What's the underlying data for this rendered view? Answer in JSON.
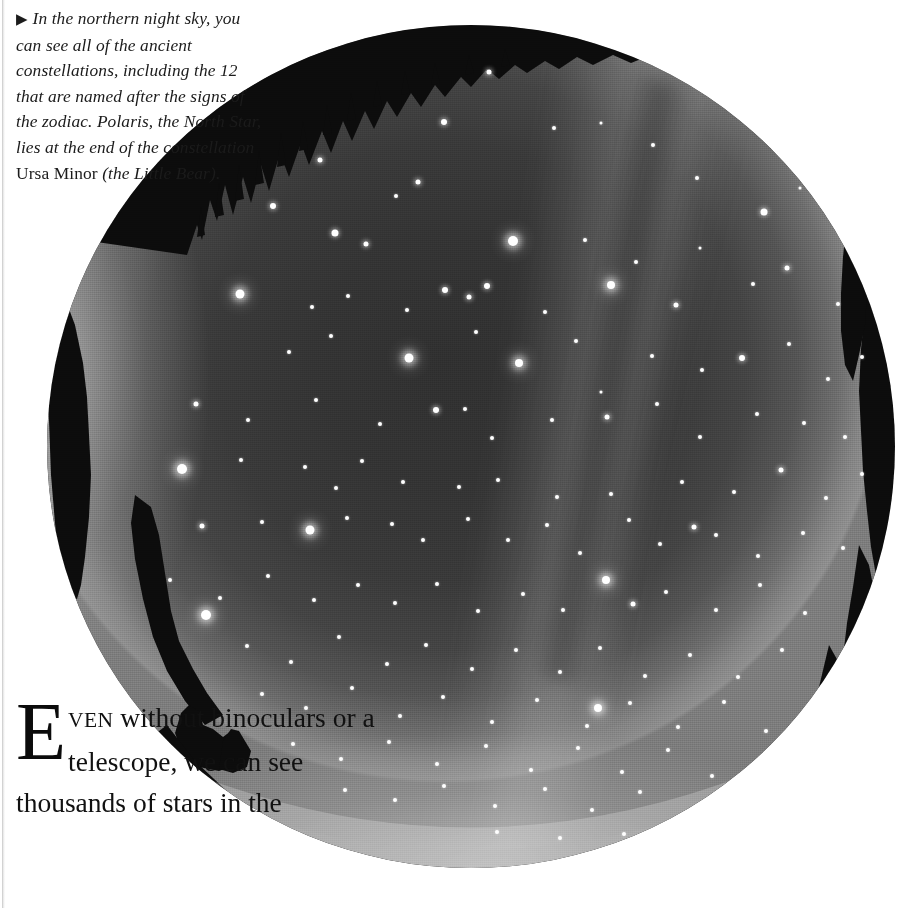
{
  "page": {
    "width": 904,
    "height": 908,
    "background_color": "#ffffff",
    "kind": "scanned-book-page"
  },
  "caption": {
    "marker_icon": "right-triangle-bullet",
    "marker_glyph": "▶",
    "line_1": "In the northern night sky, you can",
    "line_2": "see all of the ancient constellations,",
    "line_3": "including the 12 that are",
    "line_4": "named after the signs of",
    "line_5": "the zodiac. Polaris, the",
    "line_6": "North Star, lies at",
    "line_7": "the end of the",
    "line_8": "constellation",
    "line_9_roman": "Ursa Minor",
    "line_10": "(the Little",
    "line_11": "Bear).",
    "full_text": "▶ In the northern night sky, you can see all of the ancient constellations, including the 12 that are named after the signs of the zodiac. Polaris, the North Star, lies at the end of the constellation Ursa Minor (the Little Bear).",
    "style": "italic-serif",
    "text_color": "#1b1b1b"
  },
  "body": {
    "dropcap": "E",
    "smallcaps": "VEN",
    "line_1_rest": "without",
    "line_2": "binoculars or a",
    "line_3": "telescope, we can see",
    "line_4": "thousands of stars in the",
    "full_text": "EVEN without binoculars or a telescope, we can see thousands of stars in the",
    "style": "roman-serif-with-dropcap",
    "text_color": "#111111"
  },
  "photograph": {
    "name": "all-sky-fisheye-night-sky-photograph",
    "shape": "circle",
    "left": 47,
    "top": 25,
    "width": 848,
    "height": 843,
    "center_x": 471,
    "center_y": 446,
    "radius": 423,
    "sky_color_center": "#303030",
    "sky_color_mid": "#3a3a3a",
    "sky_color_rim": "#8f8f8f",
    "star_color": "#ffffff",
    "silhouette_color": "#0d0d0d",
    "features": [
      "milky-way-band",
      "dark-rift",
      "horizon-airglow",
      "treeline-silhouette"
    ],
    "stars": [
      [
        489,
        72,
        5,
        "med"
      ],
      [
        444,
        122,
        6,
        "med"
      ],
      [
        320,
        160,
        5,
        "med"
      ],
      [
        396,
        196,
        4,
        "sml"
      ],
      [
        554,
        128,
        4,
        "sml"
      ],
      [
        601,
        123,
        3,
        "sml"
      ],
      [
        653,
        145,
        4,
        "sml"
      ],
      [
        697,
        178,
        4,
        "sml"
      ],
      [
        764,
        212,
        7,
        "med"
      ],
      [
        800,
        188,
        3,
        "sml"
      ],
      [
        418,
        182,
        5,
        "med"
      ],
      [
        273,
        206,
        6,
        "med"
      ],
      [
        335,
        233,
        7,
        "med"
      ],
      [
        366,
        244,
        5,
        "med"
      ],
      [
        513,
        241,
        10,
        "big"
      ],
      [
        487,
        286,
        6,
        "med"
      ],
      [
        611,
        285,
        8,
        "big"
      ],
      [
        585,
        240,
        4,
        "sml"
      ],
      [
        636,
        262,
        4,
        "sml"
      ],
      [
        700,
        248,
        3,
        "sml"
      ],
      [
        240,
        294,
        9,
        "big"
      ],
      [
        312,
        307,
        4,
        "sml"
      ],
      [
        348,
        296,
        4,
        "sml"
      ],
      [
        407,
        310,
        4,
        "sml"
      ],
      [
        445,
        290,
        6,
        "med"
      ],
      [
        469,
        297,
        5,
        "med"
      ],
      [
        545,
        312,
        4,
        "sml"
      ],
      [
        676,
        305,
        5,
        "med"
      ],
      [
        753,
        284,
        4,
        "sml"
      ],
      [
        787,
        268,
        5,
        "med"
      ],
      [
        838,
        304,
        4,
        "sml"
      ],
      [
        289,
        352,
        4,
        "sml"
      ],
      [
        331,
        336,
        4,
        "sml"
      ],
      [
        409,
        358,
        9,
        "big"
      ],
      [
        476,
        332,
        4,
        "sml"
      ],
      [
        519,
        363,
        8,
        "big"
      ],
      [
        576,
        341,
        4,
        "sml"
      ],
      [
        601,
        392,
        3,
        "sml"
      ],
      [
        652,
        356,
        4,
        "sml"
      ],
      [
        702,
        370,
        4,
        "sml"
      ],
      [
        742,
        358,
        6,
        "med"
      ],
      [
        789,
        344,
        4,
        "sml"
      ],
      [
        828,
        379,
        4,
        "sml"
      ],
      [
        862,
        357,
        4,
        "sml"
      ],
      [
        196,
        404,
        5,
        "med"
      ],
      [
        248,
        420,
        4,
        "sml"
      ],
      [
        316,
        400,
        4,
        "sml"
      ],
      [
        380,
        424,
        4,
        "sml"
      ],
      [
        436,
        410,
        6,
        "med"
      ],
      [
        465,
        409,
        4,
        "sml"
      ],
      [
        492,
        438,
        4,
        "sml"
      ],
      [
        552,
        420,
        4,
        "sml"
      ],
      [
        607,
        417,
        5,
        "med"
      ],
      [
        657,
        404,
        4,
        "sml"
      ],
      [
        700,
        437,
        4,
        "sml"
      ],
      [
        757,
        414,
        4,
        "sml"
      ],
      [
        804,
        423,
        4,
        "sml"
      ],
      [
        845,
        437,
        4,
        "sml"
      ],
      [
        182,
        469,
        10,
        "big"
      ],
      [
        241,
        460,
        4,
        "sml"
      ],
      [
        305,
        467,
        4,
        "sml"
      ],
      [
        336,
        488,
        4,
        "sml"
      ],
      [
        362,
        461,
        4,
        "sml"
      ],
      [
        403,
        482,
        4,
        "sml"
      ],
      [
        459,
        487,
        4,
        "sml"
      ],
      [
        498,
        480,
        4,
        "sml"
      ],
      [
        557,
        497,
        4,
        "sml"
      ],
      [
        611,
        494,
        4,
        "sml"
      ],
      [
        682,
        482,
        4,
        "sml"
      ],
      [
        734,
        492,
        4,
        "sml"
      ],
      [
        781,
        470,
        5,
        "med"
      ],
      [
        826,
        498,
        4,
        "sml"
      ],
      [
        862,
        474,
        4,
        "sml"
      ],
      [
        202,
        526,
        5,
        "med"
      ],
      [
        262,
        522,
        4,
        "sml"
      ],
      [
        310,
        530,
        9,
        "big"
      ],
      [
        347,
        518,
        4,
        "sml"
      ],
      [
        392,
        524,
        4,
        "sml"
      ],
      [
        423,
        540,
        4,
        "sml"
      ],
      [
        468,
        519,
        4,
        "sml"
      ],
      [
        508,
        540,
        4,
        "sml"
      ],
      [
        547,
        525,
        4,
        "sml"
      ],
      [
        580,
        553,
        4,
        "sml"
      ],
      [
        629,
        520,
        4,
        "sml"
      ],
      [
        660,
        544,
        4,
        "sml"
      ],
      [
        694,
        527,
        5,
        "med"
      ],
      [
        716,
        535,
        4,
        "sml"
      ],
      [
        758,
        556,
        4,
        "sml"
      ],
      [
        803,
        533,
        4,
        "sml"
      ],
      [
        843,
        548,
        4,
        "sml"
      ],
      [
        170,
        580,
        4,
        "sml"
      ],
      [
        220,
        598,
        4,
        "sml"
      ],
      [
        268,
        576,
        4,
        "sml"
      ],
      [
        314,
        600,
        4,
        "sml"
      ],
      [
        358,
        585,
        4,
        "sml"
      ],
      [
        395,
        603,
        4,
        "sml"
      ],
      [
        437,
        584,
        4,
        "sml"
      ],
      [
        478,
        611,
        4,
        "sml"
      ],
      [
        523,
        594,
        4,
        "sml"
      ],
      [
        563,
        610,
        4,
        "sml"
      ],
      [
        606,
        580,
        8,
        "big"
      ],
      [
        633,
        604,
        5,
        "med"
      ],
      [
        666,
        592,
        4,
        "sml"
      ],
      [
        716,
        610,
        4,
        "sml"
      ],
      [
        760,
        585,
        4,
        "sml"
      ],
      [
        805,
        613,
        4,
        "sml"
      ],
      [
        206,
        615,
        10,
        "big"
      ],
      [
        247,
        646,
        4,
        "sml"
      ],
      [
        291,
        662,
        4,
        "sml"
      ],
      [
        339,
        637,
        4,
        "sml"
      ],
      [
        387,
        664,
        4,
        "sml"
      ],
      [
        426,
        645,
        4,
        "sml"
      ],
      [
        472,
        669,
        4,
        "sml"
      ],
      [
        516,
        650,
        4,
        "sml"
      ],
      [
        560,
        672,
        4,
        "sml"
      ],
      [
        600,
        648,
        4,
        "sml"
      ],
      [
        645,
        676,
        4,
        "sml"
      ],
      [
        690,
        655,
        4,
        "sml"
      ],
      [
        738,
        677,
        4,
        "sml"
      ],
      [
        782,
        650,
        4,
        "sml"
      ],
      [
        262,
        694,
        4,
        "sml"
      ],
      [
        306,
        708,
        4,
        "sml"
      ],
      [
        352,
        688,
        4,
        "sml"
      ],
      [
        400,
        716,
        4,
        "sml"
      ],
      [
        443,
        697,
        4,
        "sml"
      ],
      [
        492,
        722,
        4,
        "sml"
      ],
      [
        537,
        700,
        4,
        "sml"
      ],
      [
        587,
        726,
        4,
        "sml"
      ],
      [
        630,
        703,
        4,
        "sml"
      ],
      [
        678,
        727,
        4,
        "sml"
      ],
      [
        724,
        702,
        4,
        "sml"
      ],
      [
        766,
        731,
        4,
        "sml"
      ],
      [
        293,
        744,
        4,
        "sml"
      ],
      [
        341,
        759,
        4,
        "sml"
      ],
      [
        389,
        742,
        4,
        "sml"
      ],
      [
        437,
        764,
        4,
        "sml"
      ],
      [
        486,
        746,
        4,
        "sml"
      ],
      [
        531,
        770,
        4,
        "sml"
      ],
      [
        578,
        748,
        4,
        "sml"
      ],
      [
        622,
        772,
        4,
        "sml"
      ],
      [
        668,
        750,
        4,
        "sml"
      ],
      [
        712,
        776,
        4,
        "sml"
      ],
      [
        598,
        708,
        8,
        "big"
      ],
      [
        345,
        790,
        4,
        "sml"
      ],
      [
        395,
        800,
        4,
        "sml"
      ],
      [
        444,
        786,
        4,
        "sml"
      ],
      [
        495,
        806,
        4,
        "sml"
      ],
      [
        545,
        789,
        4,
        "sml"
      ],
      [
        592,
        810,
        4,
        "sml"
      ],
      [
        640,
        792,
        4,
        "sml"
      ],
      [
        690,
        812,
        4,
        "sml"
      ],
      [
        497,
        832,
        4,
        "sml"
      ],
      [
        560,
        838,
        4,
        "sml"
      ],
      [
        624,
        834,
        4,
        "sml"
      ]
    ]
  }
}
